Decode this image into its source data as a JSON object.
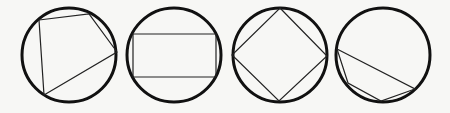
{
  "diagram": {
    "stroke_color": "#111111",
    "background": "#f7f7f5",
    "figures": [
      {
        "name": "irregular-quadrilateral",
        "circle": {
          "cx": 69,
          "cy": 55,
          "r": 47
        },
        "points": "39,20 89,14 117,52 44,95"
      },
      {
        "name": "rectangle",
        "circle": {
          "cx": 174,
          "cy": 55,
          "r": 47
        },
        "points": "133,34 216,34 216,77 133,77"
      },
      {
        "name": "square",
        "circle": {
          "cx": 280,
          "cy": 55,
          "r": 47
        },
        "points": "280,8 327,56 279,101 232,55"
      },
      {
        "name": "irregular-quadrilateral-2",
        "circle": {
          "cx": 383,
          "cy": 55,
          "r": 47
        },
        "points": "337,49 415,89 381,101 348,83"
      }
    ]
  }
}
